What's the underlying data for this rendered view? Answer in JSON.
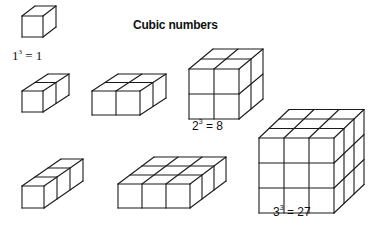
{
  "title": "Cubic numbers",
  "labels": {
    "one": {
      "base": "1",
      "exp": "3",
      "rest": " = 1"
    },
    "two": {
      "base": "2",
      "exp": "3",
      "rest": " = 8"
    },
    "three": {
      "base": "3",
      "exp": "3",
      "rest": " = 27"
    }
  },
  "figures": [
    {
      "id": "cube-1x1x1",
      "cols": 1,
      "rows": 1,
      "depth": 1,
      "x": 22,
      "y": 16,
      "cell": 21,
      "dx": 13,
      "dy": -10
    },
    {
      "id": "cube-1x1x2",
      "cols": 1,
      "rows": 1,
      "depth": 2,
      "x": 22,
      "y": 91,
      "cell": 21,
      "dx": 13,
      "dy": -8.5
    },
    {
      "id": "cube-2x1x2",
      "cols": 2,
      "rows": 1,
      "depth": 2,
      "x": 92,
      "y": 91,
      "cell": 24,
      "dx": 13,
      "dy": -8.5
    },
    {
      "id": "cube-2x2x2",
      "cols": 2,
      "rows": 2,
      "depth": 2,
      "x": 189,
      "y": 69,
      "cell": 25,
      "dx": 12,
      "dy": -10
    },
    {
      "id": "cube-1x1x3",
      "cols": 1,
      "rows": 1,
      "depth": 3,
      "x": 22,
      "y": 186,
      "cell": 22,
      "dx": 13,
      "dy": -9
    },
    {
      "id": "cube-3x1x3",
      "cols": 3,
      "rows": 1,
      "depth": 3,
      "x": 118,
      "y": 184,
      "cell": 24,
      "dx": 12,
      "dy": -9
    },
    {
      "id": "cube-3x3x3",
      "cols": 3,
      "rows": 3,
      "depth": 3,
      "x": 259,
      "y": 138,
      "cell": 25,
      "dx": 10,
      "dy": -9.5
    }
  ],
  "style": {
    "stroke": "#1a1a1a",
    "background": "#ffffff"
  }
}
